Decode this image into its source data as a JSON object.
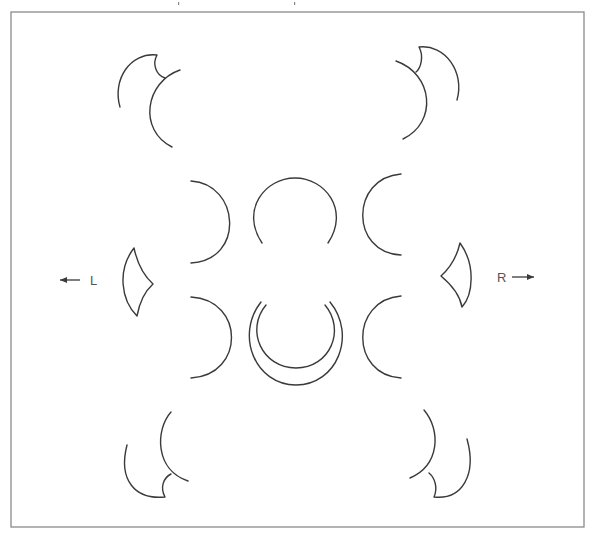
{
  "diagram": {
    "frame": {
      "x": 11,
      "y": 12,
      "width": 573,
      "height": 515,
      "stroke": "#8a8a8a"
    },
    "stroke_color": "#3a3a3a",
    "labels": {
      "left": "L",
      "right": "R"
    },
    "arrows": {
      "left": {
        "x1": 80,
        "y1": 280,
        "x2": 60,
        "y2": 280,
        "direction": "left"
      },
      "right": {
        "x1": 512,
        "y1": 277,
        "x2": 534,
        "y2": 277,
        "direction": "right"
      }
    },
    "shapes": [
      {
        "name": "top-left-cusp-outer",
        "d": "M120,107 C112,80 130,52 157,55 C152,64 156,75 165,78"
      },
      {
        "name": "top-left-cusp-inner",
        "d": "M180,70 C145,82 138,130 172,147"
      },
      {
        "name": "top-right-cusp-outer",
        "d": "M457,100 C465,72 445,44 419,47 C424,56 421,68 416,72"
      },
      {
        "name": "top-right-cusp-inner",
        "d": "M396,61 C433,74 438,122 403,139"
      },
      {
        "name": "middle-left-upper-arc",
        "d": "M191,181 C240,184 245,260 191,263"
      },
      {
        "name": "middle-center-upper-arc",
        "d": "M262,243 C240,210 265,178 295,178 C325,178 350,210 328,243"
      },
      {
        "name": "middle-right-upper-arc",
        "d": "M401,174 C350,178 350,253 401,255"
      },
      {
        "name": "middle-left-lower-arc",
        "d": "M191,297 C245,300 245,375 191,378"
      },
      {
        "name": "middle-center-lower-inner-arc",
        "d": "M266,305 C245,330 262,368 296,368 C330,368 346,330 325,305"
      },
      {
        "name": "middle-center-lower-outer-arc",
        "d": "M261,302 C235,335 255,385 296,385 C337,385 357,335 330,302"
      },
      {
        "name": "middle-right-lower-arc",
        "d": "M401,296 C350,300 350,375 401,378"
      },
      {
        "name": "left-lens",
        "d": "M134,248 C117,270 121,300 137,316 C139,305 143,293 153,284 C143,275 137,262 134,248 Z"
      },
      {
        "name": "right-lens",
        "d": "M460,243 C476,265 473,295 462,307 C460,296 453,286 441,276 C451,267 457,256 460,243 Z"
      },
      {
        "name": "bottom-left-cusp-outer",
        "d": "M127,445 C118,480 135,500 165,497 C160,488 163,478 171,474"
      },
      {
        "name": "bottom-left-cusp-inner",
        "d": "M171,412 C155,430 155,470 188,481"
      },
      {
        "name": "bottom-right-cusp-outer",
        "d": "M467,439 C477,475 462,500 434,497 C438,488 435,478 429,473"
      },
      {
        "name": "bottom-right-cusp-inner",
        "d": "M424,410 C441,430 440,465 410,478"
      }
    ],
    "top_ticks": [
      {
        "x": 178,
        "y": 2
      },
      {
        "x": 294,
        "y": 2
      }
    ]
  }
}
